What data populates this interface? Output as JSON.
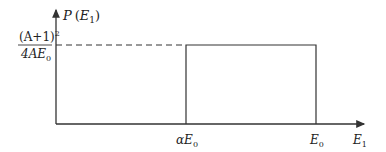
{
  "diagram": {
    "type": "step-distribution",
    "y_axis": {
      "label_prefix": "P",
      "label_open": "(",
      "label_var": "E",
      "label_sub": "1",
      "label_close": ")"
    },
    "x_axis": {
      "label_var": "E",
      "label_sub": "1"
    },
    "level_label": {
      "numerator_main": "(A+1)",
      "numerator_sup": "2",
      "denominator_main": "4AE",
      "denominator_sub": "0"
    },
    "x_ticks": [
      {
        "prefix": "α",
        "var": "E",
        "sub": "0"
      },
      {
        "prefix": "",
        "var": "E",
        "sub": "0"
      }
    ],
    "colors": {
      "line": "#333333",
      "text": "#222222"
    }
  }
}
